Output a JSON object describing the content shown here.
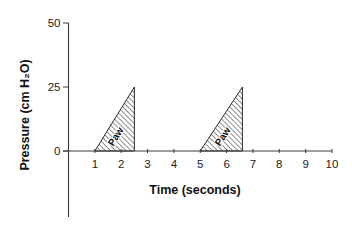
{
  "chart_data": {
    "type": "area",
    "title": "",
    "xlabel": "Time (seconds)",
    "ylabel": "Pressure (cm H₂O)",
    "xlim": [
      0,
      10
    ],
    "ylim": [
      -25,
      50
    ],
    "x_ticks": [
      1,
      2,
      3,
      4,
      5,
      6,
      7,
      8,
      9,
      10
    ],
    "y_ticks": [
      0,
      25,
      50
    ],
    "grid": false,
    "legend": null,
    "series": [
      {
        "name": "Paw",
        "style": "hatched triangle",
        "segments": [
          {
            "x": [
              1,
              2.5,
              2.5
            ],
            "y": [
              0,
              25,
              0
            ],
            "label": "Paw"
          },
          {
            "x": [
              5,
              6.6,
              6.6
            ],
            "y": [
              0,
              25,
              0
            ],
            "label": "Paw"
          }
        ]
      }
    ],
    "annotations": [
      "Paw",
      "Paw"
    ]
  }
}
